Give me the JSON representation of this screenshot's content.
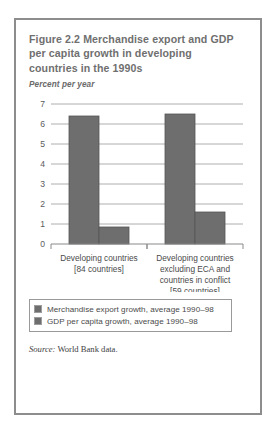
{
  "figure": {
    "title": "Figure 2.2  Merchandise export and GDP per capita growth in developing countries in the 1990s",
    "subtitle": "Percent per year",
    "source_label": "Source:",
    "source_text": " World Bank data."
  },
  "colors": {
    "bar_fill": "#6e6e6e",
    "bar_stroke": "#555555",
    "gridline": "#aeaeae",
    "axis": "#8a8a8a",
    "frame": "#8d8d8d",
    "title_text": "#6f6f6f"
  },
  "chart_data": {
    "type": "bar",
    "title": "Figure 2.2  Merchandise export and GDP per capita growth in developing countries in the 1990s",
    "xlabel": "",
    "ylabel": "Percent per year",
    "ylim": [
      0,
      7
    ],
    "yticks": [
      0,
      1,
      2,
      3,
      4,
      5,
      6,
      7
    ],
    "ytick_labels": [
      "0",
      "1",
      "2",
      "3",
      "4",
      "5",
      "6",
      "7"
    ],
    "grid": true,
    "legend_position": "below",
    "categories": [
      "Developing countries [84 countries]",
      "Developing countries excluding ECA and countries in conflict [59 countries]"
    ],
    "category_lines": [
      [
        "Developing countries",
        "[84 countries]"
      ],
      [
        "Developing countries",
        "excluding ECA and",
        "countries in conflict",
        "[59 countries]"
      ]
    ],
    "series": [
      {
        "name": "Merchandise export growth, average 1990–98",
        "values": [
          6.4,
          6.5
        ],
        "color": "#6e6e6e"
      },
      {
        "name": "GDP per capita growth, average 1990–98",
        "values": [
          0.85,
          1.6
        ],
        "color": "#6e6e6e"
      }
    ]
  }
}
